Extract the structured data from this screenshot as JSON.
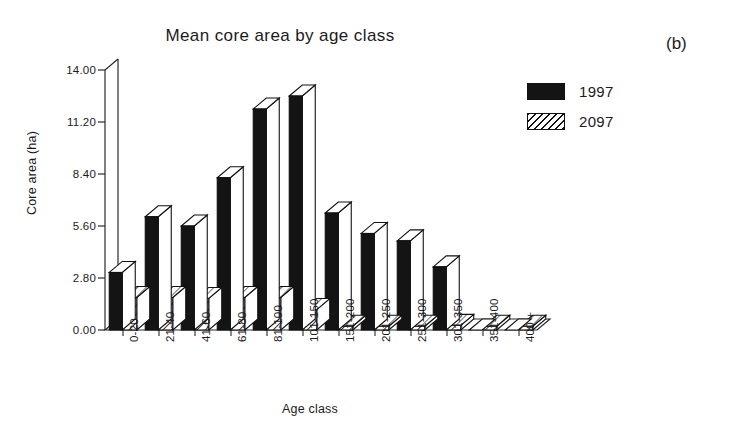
{
  "panel": {
    "label": "(b)"
  },
  "chart_data": {
    "type": "bar",
    "title": "Mean core area by age class",
    "xlabel": "Age class",
    "ylabel": "Core area (ha)",
    "ylim": [
      0,
      14
    ],
    "yticks": [
      "0.00",
      "2.80",
      "5.60",
      "8.40",
      "11.20",
      "14.00"
    ],
    "ytick_values": [
      0,
      2.8,
      5.6,
      8.4,
      11.2,
      14
    ],
    "grid": false,
    "legend_position": "top-right",
    "style": "3d-column",
    "categories": [
      "0-20",
      "21-40",
      "41-60",
      "61-80",
      "81-100",
      "101-150",
      "151-200",
      "201-250",
      "251-300",
      "301-350",
      "351-400",
      "400 +"
    ],
    "series": [
      {
        "name": "1997",
        "color": "#141414",
        "fill": "solid",
        "values": [
          3.1,
          6.1,
          5.6,
          8.2,
          11.9,
          12.6,
          6.3,
          5.2,
          4.8,
          3.4,
          0.0,
          0.0
        ]
      },
      {
        "name": "2097",
        "color": "#ffffff",
        "fill": "diagonal-hatch",
        "values": [
          1.75,
          1.75,
          1.7,
          1.75,
          1.75,
          1.1,
          0.2,
          0.2,
          0.2,
          0.25,
          0.2,
          0.2
        ]
      }
    ]
  }
}
